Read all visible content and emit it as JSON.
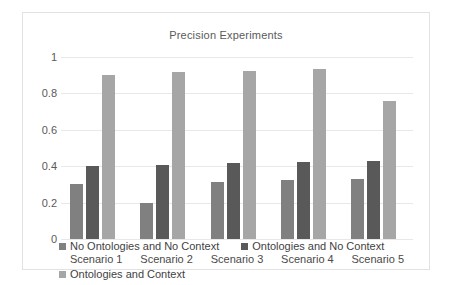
{
  "chart_data": {
    "type": "bar",
    "title": "Precision Experiments",
    "xlabel": "",
    "ylabel": "",
    "ylim": [
      0,
      1
    ],
    "yticks": [
      "0",
      "0.2",
      "0.4",
      "0.6",
      "0.8",
      "1"
    ],
    "grid": "horizontal",
    "legend_position": "bottom",
    "categories": [
      "Scenario 1",
      "Scenario 2",
      "Scenario 3",
      "Scenario 4",
      "Scenario 5"
    ],
    "series": [
      {
        "name": "No Ontologies and No Context",
        "color": "#808080",
        "values": [
          0.3,
          0.2,
          0.315,
          0.325,
          0.33
        ]
      },
      {
        "name": "Ontologies and No Context",
        "color": "#595959",
        "values": [
          0.4,
          0.405,
          0.415,
          0.425,
          0.43
        ]
      },
      {
        "name": "Ontologies and Context",
        "color": "#a6a6a6",
        "values": [
          0.9,
          0.915,
          0.925,
          0.935,
          0.76
        ]
      }
    ]
  }
}
